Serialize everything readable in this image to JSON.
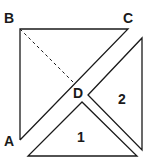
{
  "diagram": {
    "labels": {
      "A": "A",
      "B": "B",
      "C": "C",
      "D": "D",
      "piece1": "1",
      "piece2": "2"
    },
    "colors": {
      "stroke": "#1a1a1a",
      "background": "#ffffff"
    }
  }
}
